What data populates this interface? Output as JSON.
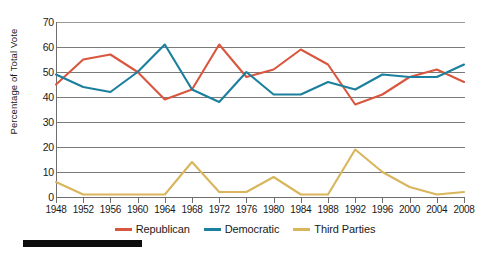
{
  "chart_data": {
    "type": "line",
    "title": "",
    "xlabel": "",
    "ylabel": "Percentage of Total Vote",
    "ylim": [
      0,
      70
    ],
    "ytick_step": 10,
    "yticks": [
      0,
      10,
      20,
      30,
      40,
      50,
      60,
      70
    ],
    "grid": true,
    "legend_position": "bottom-center",
    "categories": [
      1948,
      1952,
      1956,
      1960,
      1964,
      1968,
      1972,
      1976,
      1980,
      1984,
      1988,
      1992,
      1996,
      2000,
      2004,
      2008
    ],
    "x": [
      "1948",
      "1952",
      "1956",
      "1960",
      "1964",
      "1968",
      "1972",
      "1976",
      "1980",
      "1984",
      "1988",
      "1992",
      "1996",
      "2000",
      "2004",
      "2008"
    ],
    "series": [
      {
        "name": "Republican",
        "color": "#D9563F",
        "values": [
          45,
          55,
          57,
          50,
          39,
          43,
          61,
          48,
          51,
          59,
          53,
          37,
          41,
          48,
          51,
          46
        ]
      },
      {
        "name": "Democratic",
        "color": "#1B7F9E",
        "values": [
          49,
          44,
          42,
          50,
          61,
          43,
          38,
          50,
          41,
          41,
          46,
          43,
          49,
          48,
          48,
          53
        ]
      },
      {
        "name": "Third Parties",
        "color": "#D9B65C",
        "values": [
          6,
          1,
          1,
          1,
          1,
          14,
          2,
          2,
          8,
          1,
          1,
          19,
          10,
          4,
          1,
          2
        ]
      }
    ]
  },
  "axis": {
    "y_title": "Percentage of Total Vote",
    "y_tick_labels": [
      "70",
      "60",
      "50",
      "40",
      "30",
      "20",
      "10",
      "0"
    ],
    "x_tick_labels": [
      "1948",
      "1952",
      "1956",
      "1960",
      "1964",
      "1968",
      "1972",
      "1976",
      "1980",
      "1984",
      "1988",
      "1992",
      "1996",
      "2000",
      "2004",
      "2008"
    ]
  },
  "legend": {
    "items": [
      {
        "label": "Republican",
        "color": "#D9563F"
      },
      {
        "label": "Democratic",
        "color": "#1B7F9E"
      },
      {
        "label": "Third Parties",
        "color": "#D9B65C"
      }
    ]
  }
}
